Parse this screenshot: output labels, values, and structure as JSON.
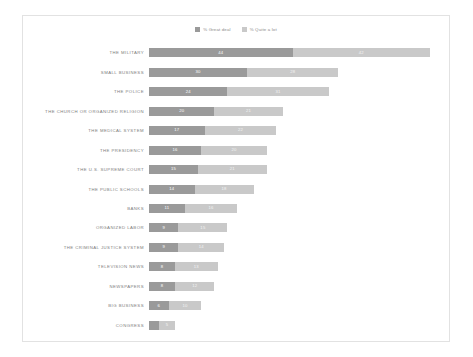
{
  "legend": {
    "items": [
      {
        "label": "% Great deal",
        "color": "#9a9a9a",
        "key": "great_deal"
      },
      {
        "label": "% Quite a lot",
        "color": "#c9c9c9",
        "key": "quite_a_lot"
      }
    ]
  },
  "chart_data": {
    "type": "bar",
    "title": "",
    "xlabel": "",
    "ylabel": "",
    "orientation": "horizontal",
    "stacked": true,
    "grid": false,
    "legend_position": "top-center",
    "xlim": [
      0,
      90
    ],
    "categories": [
      "THE MILITARY",
      "SMALL BUSINESS",
      "THE POLICE",
      "THE CHURCH OR ORGANIZED RELIGION",
      "THE MEDICAL SYSTEM",
      "THE PRESIDENCY",
      "THE U.S. SUPREME COURT",
      "THE PUBLIC SCHOOLS",
      "BANKS",
      "ORGANIZED LABOR",
      "THE CRIMINAL JUSTICE SYSTEM",
      "TELEVISION NEWS",
      "NEWSPAPERS",
      "BIG BUSINESS",
      "CONGRESS"
    ],
    "series": [
      {
        "name": "% Great deal",
        "color": "#9a9a9a",
        "values": [
          44,
          30,
          24,
          20,
          17,
          16,
          15,
          14,
          11,
          9,
          9,
          8,
          8,
          6,
          3
        ]
      },
      {
        "name": "% Quite a lot",
        "color": "#c9c9c9",
        "values": [
          42,
          28,
          31,
          21,
          22,
          20,
          21,
          18,
          16,
          15,
          14,
          13,
          12,
          10,
          5
        ]
      }
    ]
  }
}
